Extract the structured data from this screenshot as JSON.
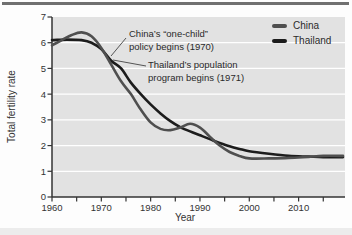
{
  "figure": {
    "legend": [
      {
        "label": "China",
        "color": "#4f4f4f"
      },
      {
        "label": "Thailand",
        "color": "#1c1c1c"
      }
    ],
    "annotations": [
      {
        "lines": [
          "China’s “one-child”",
          "policy begins (1970)"
        ],
        "leader": {
          "x1": 126,
          "y1": 38,
          "x2": 111,
          "y2": 56
        }
      },
      {
        "lines": [
          "Thailand’s population",
          "program begins (1971)"
        ],
        "leader": {
          "x1": 146,
          "y1": 66,
          "x2": 113,
          "y2": 60
        }
      }
    ],
    "colors": {
      "panel": "#e2e2e2",
      "gridline": "#ffffff",
      "axis": "#333333",
      "top_rule": "#707070"
    }
  },
  "chart_data": {
    "type": "line",
    "title": "",
    "xlabel": "Year",
    "ylabel": "Total fertility rate",
    "xlim": [
      1960,
      2019
    ],
    "ylim": [
      0,
      7
    ],
    "x_tick_labels": [
      1960,
      1970,
      1980,
      1990,
      2000,
      2010
    ],
    "x_minor_tick_step": 5,
    "y_ticks": [
      0,
      1,
      2,
      3,
      4,
      5,
      6,
      7
    ],
    "grid": "horizontal white gridlines at integer values on gray panel",
    "legend_position": "top-right",
    "series": [
      {
        "name": "China",
        "color": "#4f4f4f",
        "points": [
          [
            1960,
            5.9
          ],
          [
            1962,
            6.1
          ],
          [
            1964,
            6.3
          ],
          [
            1966,
            6.4
          ],
          [
            1968,
            6.25
          ],
          [
            1970,
            5.8
          ],
          [
            1972,
            5.15
          ],
          [
            1974,
            4.5
          ],
          [
            1976,
            4.0
          ],
          [
            1978,
            3.4
          ],
          [
            1980,
            2.9
          ],
          [
            1982,
            2.65
          ],
          [
            1984,
            2.6
          ],
          [
            1986,
            2.7
          ],
          [
            1988,
            2.85
          ],
          [
            1990,
            2.7
          ],
          [
            1992,
            2.35
          ],
          [
            1994,
            2.0
          ],
          [
            1996,
            1.75
          ],
          [
            1998,
            1.6
          ],
          [
            2000,
            1.5
          ],
          [
            2004,
            1.5
          ],
          [
            2008,
            1.52
          ],
          [
            2012,
            1.56
          ],
          [
            2015,
            1.6
          ],
          [
            2019,
            1.6
          ]
        ]
      },
      {
        "name": "Thailand",
        "color": "#1c1c1c",
        "points": [
          [
            1960,
            6.1
          ],
          [
            1963,
            6.12
          ],
          [
            1966,
            6.1
          ],
          [
            1968,
            6.0
          ],
          [
            1970,
            5.75
          ],
          [
            1972,
            5.3
          ],
          [
            1974,
            5.0
          ],
          [
            1976,
            4.45
          ],
          [
            1978,
            4.0
          ],
          [
            1980,
            3.6
          ],
          [
            1982,
            3.25
          ],
          [
            1984,
            2.95
          ],
          [
            1986,
            2.72
          ],
          [
            1988,
            2.55
          ],
          [
            1990,
            2.4
          ],
          [
            1992,
            2.25
          ],
          [
            1994,
            2.1
          ],
          [
            1996,
            1.97
          ],
          [
            1998,
            1.87
          ],
          [
            2000,
            1.78
          ],
          [
            2004,
            1.68
          ],
          [
            2008,
            1.6
          ],
          [
            2012,
            1.57
          ],
          [
            2015,
            1.55
          ],
          [
            2019,
            1.55
          ]
        ]
      }
    ],
    "annotations": [
      {
        "text": "China’s “one-child” policy begins (1970)",
        "points_to": {
          "year": 1971,
          "value": 5.5
        }
      },
      {
        "text": "Thailand’s population program begins (1971)",
        "points_to": {
          "year": 1972,
          "value": 5.3
        }
      }
    ]
  }
}
